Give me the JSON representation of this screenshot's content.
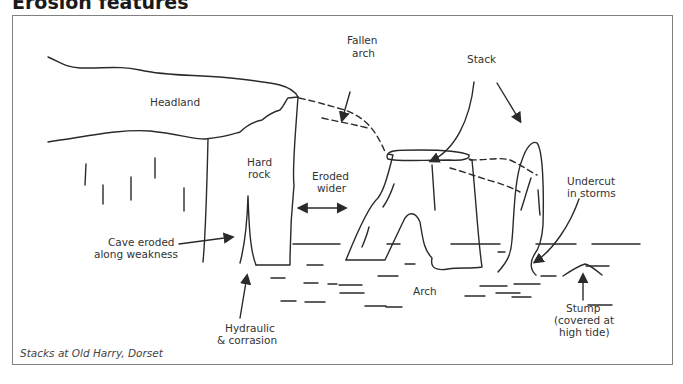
{
  "title": "Erosion features",
  "caption": "Stacks at Old Harry, Dorset",
  "labels": {
    "headland": "Headland",
    "fallen_arch_1": "Fallen",
    "fallen_arch_2": "arch",
    "stack": "Stack",
    "hard_rock_1": "Hard",
    "hard_rock_2": "rock",
    "eroded_wider_1": "Eroded",
    "eroded_wider_2": "wider",
    "undercut_1": "Undercut",
    "undercut_2": "in storms",
    "cave_1": "Cave eroded",
    "cave_2": "along weakness",
    "arch": "Arch",
    "hydraulic_1": "Hydraulic",
    "hydraulic_2": "& corrasion",
    "stump_1": "Stump",
    "stump_2": "(covered at",
    "stump_3": "high tide)"
  },
  "colors": {
    "line": "#2a2a2a",
    "frame": "#808080",
    "text": "#333333"
  }
}
